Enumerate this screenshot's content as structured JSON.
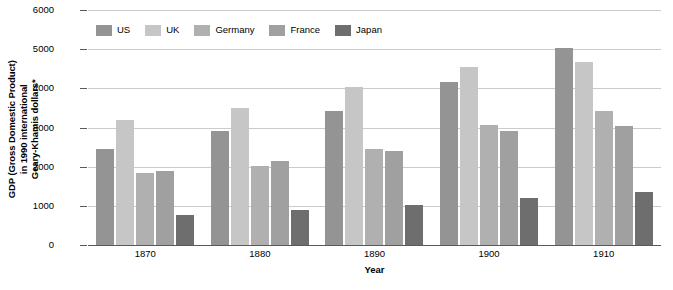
{
  "chart_data": {
    "type": "bar",
    "title": "",
    "xlabel": "Year",
    "ylabel": "GDP (Gross Domestic Product) in 1990 international Geary-Khamis dollars*",
    "ylabel_lines": [
      "GDP (Gross Domestic Product)",
      "in 1990 international",
      "Geary-Khamis dollars*"
    ],
    "categories": [
      "1870",
      "1880",
      "1890",
      "1900",
      "1910"
    ],
    "ylim": [
      0,
      6000
    ],
    "yticks": [
      0,
      1000,
      2000,
      3000,
      4000,
      5000,
      6000
    ],
    "ytick_labels": [
      "0",
      "1000",
      "2000",
      "3000",
      "4000",
      "5000",
      "6000"
    ],
    "grid": true,
    "legend_position": "top-left-inside",
    "series": [
      {
        "name": "US",
        "color": "#949494",
        "values": [
          2445,
          2900,
          3425,
          4150,
          5030
        ]
      },
      {
        "name": "UK",
        "color": "#c6c6c6",
        "values": [
          3190,
          3510,
          4030,
          4550,
          4680
        ]
      },
      {
        "name": "Germany",
        "color": "#b0b0b0",
        "values": [
          1840,
          2020,
          2440,
          3060,
          3420
        ]
      },
      {
        "name": "France",
        "color": "#a0a0a0",
        "values": [
          1880,
          2140,
          2400,
          2920,
          3030
        ]
      },
      {
        "name": "Japan",
        "color": "#6e6e6e",
        "values": [
          760,
          890,
          1030,
          1200,
          1350
        ]
      }
    ]
  }
}
